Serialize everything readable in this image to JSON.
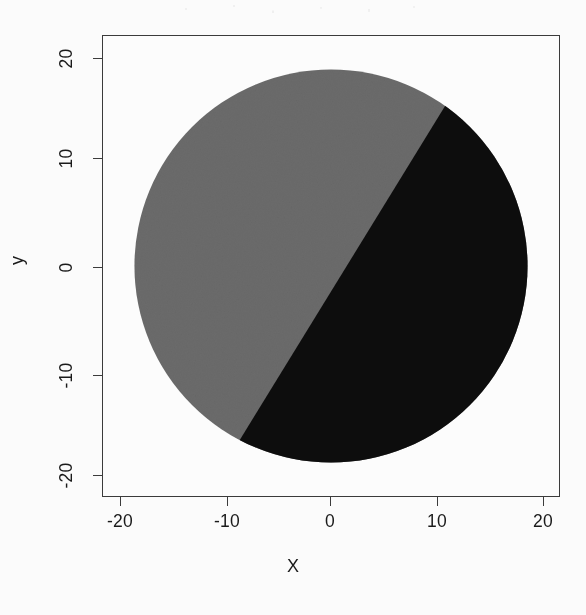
{
  "figure": {
    "background_color": "#fbfbfb",
    "frame_color": "#3b3b3b"
  },
  "axes": {
    "x_label": "X",
    "y_label": "y",
    "x_ticks": [
      "-20",
      "-10",
      "0",
      "10",
      "20"
    ],
    "y_ticks": [
      "20",
      "10",
      "0",
      "-10",
      "-20"
    ]
  },
  "chart_data": {
    "type": "scatter",
    "title": "",
    "subtitle": "",
    "xlabel": "X",
    "ylabel": "y",
    "xlim": [
      -23.2,
      23.2
    ],
    "ylim": [
      -23.2,
      23.2
    ],
    "xticks": [
      -20,
      -10,
      0,
      10,
      20
    ],
    "yticks": [
      -20,
      -10,
      0,
      10,
      20
    ],
    "xticklabels": [
      "-20",
      "-10",
      "0",
      "10",
      "20"
    ],
    "yticklabels": [
      "20",
      "10",
      "0",
      "-10",
      "-20"
    ],
    "grid": false,
    "legend": null,
    "annotations": [],
    "shape": {
      "kind": "filled-disk",
      "center": [
        0.0,
        0.0
      ],
      "radius": 20.0
    },
    "decision_boundary": {
      "kind": "line",
      "point_top": [
        14.0,
        20.0
      ],
      "point_bottom": [
        -10.8,
        -20.0
      ],
      "slope": 1.612,
      "intercept": 2.43,
      "equation": "y = 1.612*x + 2.43"
    },
    "series": [
      {
        "name": "class-gray",
        "side": "left-of-boundary",
        "color": "#6b6b6b",
        "area_fraction": 0.47
      },
      {
        "name": "class-black",
        "side": "right-of-boundary",
        "color": "#0d0d0d",
        "area_fraction": 0.53
      }
    ],
    "colors": {
      "class_gray": "#6b6b6b",
      "class_black": "#0d0d0d",
      "background": "#fcfcfc",
      "frame": "#3b3b3b"
    }
  }
}
